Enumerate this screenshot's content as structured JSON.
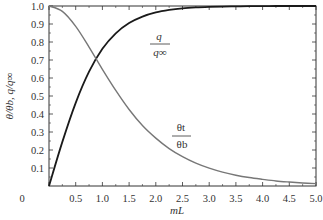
{
  "chart_data": {
    "type": "line",
    "title": "",
    "xlabel": "mL",
    "ylabel": "θ/θb, q/q∞",
    "xlim": [
      0,
      5.0
    ],
    "ylim": [
      0,
      1.0
    ],
    "grid": false,
    "legend": "inline curve labels",
    "x_ticks": [
      "0",
      "0.5",
      "1.0",
      "1.5",
      "2.0",
      "2.5",
      "3.0",
      "3.5",
      "4.0",
      "4.5",
      "5.0"
    ],
    "y_ticks": [
      "0.1",
      "0.2",
      "0.3",
      "0.4",
      "0.5",
      "0.6",
      "0.7",
      "0.8",
      "0.9",
      "1.0"
    ],
    "x": [
      0,
      0.25,
      0.5,
      0.75,
      1.0,
      1.25,
      1.5,
      1.75,
      2.0,
      2.25,
      2.5,
      2.75,
      3.0,
      3.25,
      3.5,
      3.75,
      4.0,
      4.25,
      4.5,
      4.75,
      5.0
    ],
    "series": [
      {
        "name": "q/q∞",
        "label_num": "q",
        "label_den": "q∞",
        "color": "#1a1a1a",
        "values": [
          0,
          0.245,
          0.462,
          0.635,
          0.762,
          0.848,
          0.905,
          0.941,
          0.964,
          0.978,
          0.987,
          0.992,
          0.995,
          0.997,
          0.998,
          0.999,
          0.999,
          1.0,
          1.0,
          1.0,
          1.0
        ]
      },
      {
        "name": "θt/θb",
        "label_num": "θt",
        "label_den": "θb",
        "color": "#777777",
        "values": [
          1.0,
          0.97,
          0.887,
          0.772,
          0.648,
          0.531,
          0.425,
          0.336,
          0.266,
          0.208,
          0.163,
          0.127,
          0.099,
          0.077,
          0.06,
          0.047,
          0.037,
          0.028,
          0.022,
          0.017,
          0.013
        ]
      }
    ]
  }
}
